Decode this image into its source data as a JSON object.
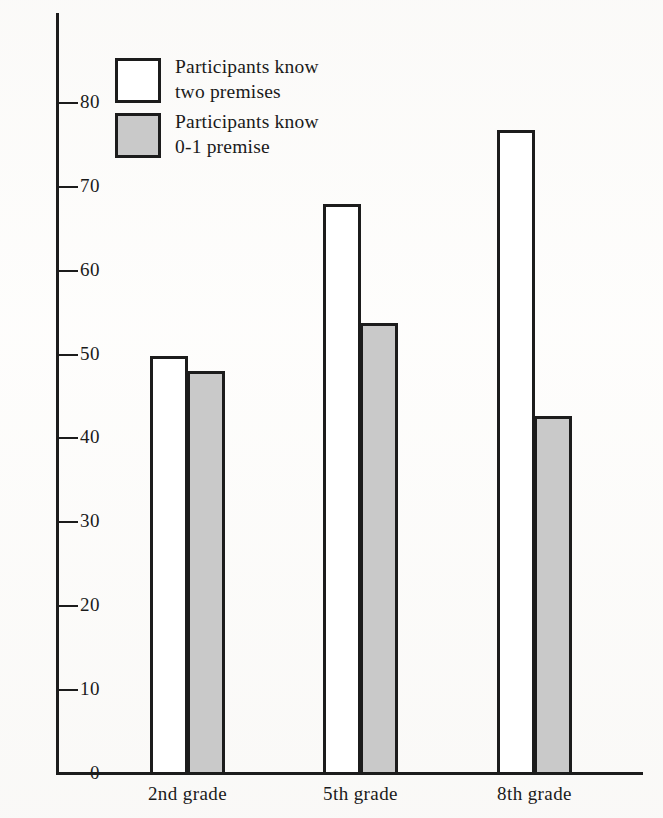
{
  "chart_data": {
    "type": "bar",
    "title": "",
    "subtitle": "",
    "xlabel": "",
    "ylabel": "",
    "categories": [
      "2nd grade",
      "5th grade",
      "8th grade"
    ],
    "series": [
      {
        "name": "Participants know two premises",
        "values": [
          49.7,
          67.8,
          76.6
        ],
        "fill": "#ffffff",
        "stroke": "#1c1c1c"
      },
      {
        "name": "Participants know 0-1 premise",
        "values": [
          47.9,
          53.6,
          42.6
        ],
        "fill": "#c9c9c9",
        "stroke": "#1c1c1c"
      }
    ],
    "ylim": [
      0,
      85
    ],
    "yticks": [
      0,
      10,
      20,
      30,
      40,
      50,
      60,
      70,
      80
    ],
    "ytick_labels": [
      "0",
      "10",
      "20",
      "30",
      "40",
      "50",
      "60",
      "70",
      "80"
    ],
    "grid": false,
    "legend_position": "top-left"
  },
  "legend": {
    "entries": [
      {
        "label": "Participants know\ntwo premises",
        "swatch": "light"
      },
      {
        "label": "Participants know\n0-1 premise",
        "swatch": "shaded"
      }
    ]
  },
  "axes": {
    "y_tick_labels": [
      "80",
      "70",
      "60",
      "50",
      "40",
      "30",
      "20",
      "10",
      "0"
    ],
    "x_category_labels": [
      "2nd grade",
      "5th grade",
      "8th grade"
    ]
  },
  "colors": {
    "ink": "#1c1c1c",
    "shaded_fill": "#c9c9c9",
    "light_fill": "#ffffff",
    "background": "#ffffff"
  }
}
